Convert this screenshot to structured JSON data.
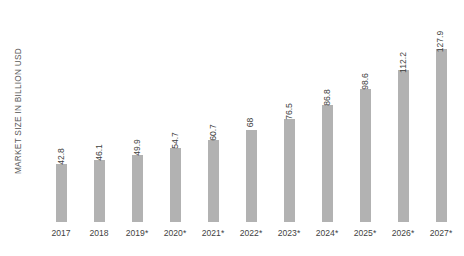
{
  "chart_data": {
    "type": "bar",
    "title": "",
    "subtitle": "",
    "xlabel": "",
    "ylabel": "MARKET SIZE IN BILLION USD",
    "categories": [
      "2017",
      "2018",
      "2019*",
      "2020*",
      "2021*",
      "2022*",
      "2023*",
      "2024*",
      "2025*",
      "2026*",
      "2027*"
    ],
    "values": [
      42.8,
      46.1,
      49.9,
      54.7,
      60.7,
      68,
      76.5,
      86.8,
      98.6,
      112.2,
      127.9
    ],
    "value_labels": [
      "42.8",
      "46.1",
      "49.9",
      "54.7",
      "60.7",
      "68",
      "76.5",
      "86.8",
      "98.6",
      "112.2",
      "127.9"
    ],
    "series": [
      {
        "name": "Market size",
        "values": [
          42.8,
          46.1,
          49.9,
          54.7,
          60.7,
          68,
          76.5,
          86.8,
          98.6,
          112.2,
          127.9
        ]
      }
    ],
    "ylim": [
      0,
      128
    ],
    "grid": false,
    "legend": false,
    "legend_position": "none",
    "bar_color": "#b2b2b2",
    "label_color": "#3f3f3f",
    "axis_title_color": "#595959",
    "background_color": "#ffffff",
    "value_label_rotation": -90,
    "axis_line": false,
    "tick_marks": false,
    "annotations": [
      "* denotes forecast years"
    ]
  }
}
